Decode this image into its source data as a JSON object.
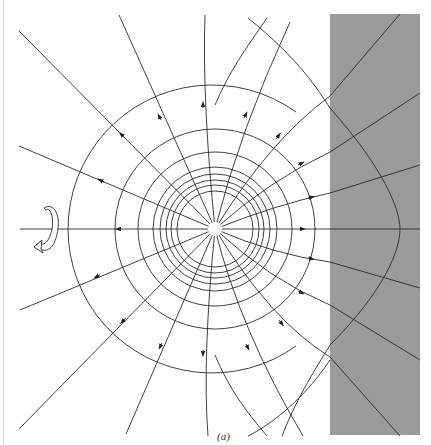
{
  "figure": {
    "caption": "(a)",
    "colors": {
      "background": "#ffffff",
      "dielectric": "#9b9b9b",
      "line": "#2a2a2a"
    },
    "center": [
      215,
      229
    ],
    "dielectric_region": {
      "x": 330,
      "y": 14,
      "width": 90,
      "height": 421
    },
    "equipotential_radii": [
      38,
      44,
      49,
      55,
      62,
      77,
      100
    ],
    "rotation_symbol": "rotational-symmetry-arrow"
  }
}
